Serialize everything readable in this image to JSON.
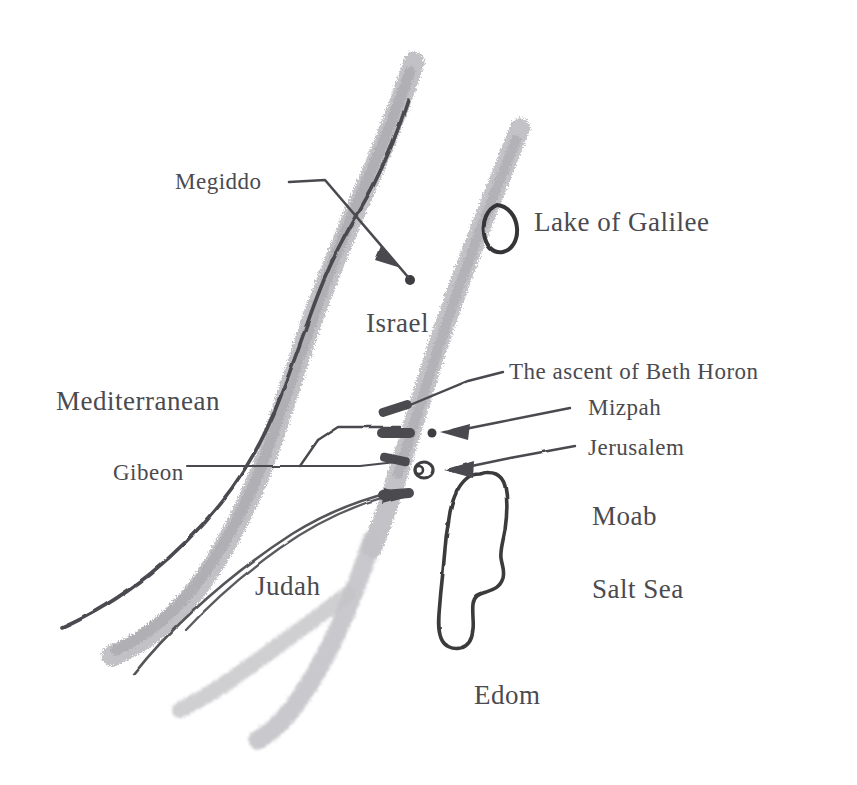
{
  "map": {
    "title": "Map of ancient Israel and Judah",
    "style": "hand-drawn pencil sketch, grayscale",
    "background_color": "#ffffff",
    "text_color": "#4a4a4f",
    "ridge_color": "#b9b9bd",
    "ink_color": "#4a4a4f",
    "width": 857,
    "height": 785
  },
  "labels": {
    "megiddo": {
      "text": "Megiddo",
      "kind": "site",
      "x": 175,
      "y": 170
    },
    "lake_galilee": {
      "text": "Lake of Galilee",
      "kind": "water",
      "x": 534,
      "y": 209
    },
    "israel": {
      "text": "Israel",
      "kind": "region",
      "x": 366,
      "y": 310
    },
    "beth_horon": {
      "text": "The ascent of Beth Horon",
      "kind": "route",
      "x": 509,
      "y": 360
    },
    "mediterranean": {
      "text": "Mediterranean",
      "kind": "water",
      "x": 56,
      "y": 388
    },
    "mizpah": {
      "text": "Mizpah",
      "kind": "site",
      "x": 588,
      "y": 396
    },
    "jerusalem": {
      "text": "Jerusalem",
      "kind": "site",
      "x": 588,
      "y": 436
    },
    "gibeon": {
      "text": "Gibeon",
      "kind": "site",
      "x": 113,
      "y": 461
    },
    "moab": {
      "text": "Moab",
      "kind": "region",
      "x": 592,
      "y": 503
    },
    "salt_sea": {
      "text": "Salt Sea",
      "kind": "water",
      "x": 592,
      "y": 576
    },
    "judah": {
      "text": "Judah",
      "kind": "region",
      "x": 255,
      "y": 573
    },
    "edom": {
      "text": "Edom",
      "kind": "region",
      "x": 474,
      "y": 682
    }
  },
  "features": [
    {
      "name": "western-hill-ridge",
      "type": "ridge-band",
      "label": "western hill country ridge"
    },
    {
      "name": "eastern-hill-ridge",
      "type": "ridge-band",
      "label": "eastern (Transjordan) ridge"
    },
    {
      "name": "southern-ridge-spur",
      "type": "ridge-band",
      "label": "southern ridge spur"
    },
    {
      "name": "mediterranean-coastline",
      "type": "ink-line",
      "label": "Mediterranean coastline"
    },
    {
      "name": "lake-of-galilee-outline",
      "type": "water-outline",
      "label": "Lake of Galilee"
    },
    {
      "name": "salt-sea-outline",
      "type": "water-outline",
      "label": "Salt Sea (Dead Sea)"
    },
    {
      "name": "megiddo-marker",
      "type": "site-dot",
      "label": "Megiddo site dot"
    },
    {
      "name": "jerusalem-marker",
      "type": "site-ring",
      "label": "Jerusalem double ring"
    },
    {
      "name": "mizpah-marker",
      "type": "site-dot",
      "label": "Mizpah dot"
    }
  ],
  "leaders": [
    {
      "name": "megiddo-leader",
      "from": "Megiddo",
      "arrow": true
    },
    {
      "name": "beth-horon-leader",
      "from": "The ascent of Beth Horon",
      "arrow": false
    },
    {
      "name": "mizpah-leader",
      "from": "Mizpah",
      "arrow": true
    },
    {
      "name": "jerusalem-leader",
      "from": "Jerusalem",
      "arrow": true
    },
    {
      "name": "gibeon-leader",
      "from": "Gibeon",
      "arrow": false
    },
    {
      "name": "gibeon-route-upper",
      "from": "Gibeon",
      "arrow": true
    },
    {
      "name": "gibeon-route-lower",
      "from": "Gibeon",
      "arrow": true
    }
  ]
}
